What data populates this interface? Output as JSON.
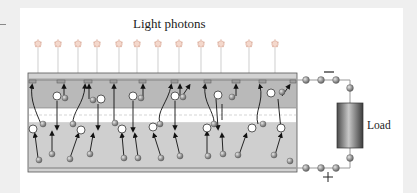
{
  "diagram": {
    "title": "Light photons",
    "load_label": "Load",
    "negative_terminal": "−",
    "positive_terminal": "+",
    "layers": [
      "n-type layer",
      "junction",
      "p-type layer"
    ],
    "photon_count": 14,
    "colors": {
      "page_background": "#efefef",
      "panel_background": "#ffffff",
      "n_layer": "#b9b9b9",
      "p_layer": "#cfcfcf",
      "junction": "#ffffff",
      "contact": "#a8a8a8",
      "electron": "#8a8a8a",
      "hole": "#ffffff",
      "load_dark": "#555555",
      "load_light": "#c9c9c9"
    }
  }
}
